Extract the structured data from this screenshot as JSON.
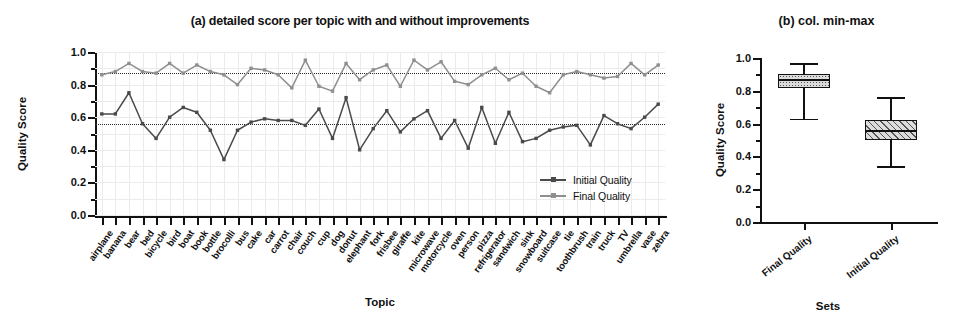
{
  "chart_data": [
    {
      "type": "line",
      "panel": "a",
      "title": "(a) detailed score per topic with and without improvements",
      "xlabel": "Topic",
      "ylabel": "Quality Score",
      "ylim": [
        0.0,
        1.0
      ],
      "yticks": [
        "0.0",
        "0.2",
        "0.4",
        "0.6",
        "0.8",
        "1.0"
      ],
      "grid": true,
      "legend_position": "bottom-right",
      "categories": [
        "airplane",
        "banana",
        "bear",
        "bed",
        "bicycle",
        "bird",
        "boat",
        "book",
        "bottle",
        "brocolli",
        "bus",
        "cake",
        "car",
        "carrot",
        "chair",
        "couch",
        "cup",
        "dog",
        "donut",
        "elephant",
        "fork",
        "frisbee",
        "giraffe",
        "kite",
        "microwave",
        "motorcycle",
        "oven",
        "person",
        "pizza",
        "refrigerator",
        "sandwich",
        "sink",
        "snowboard",
        "suitcase",
        "tie",
        "toothbrush",
        "train",
        "truck",
        "TV",
        "umbrella",
        "vase",
        "zebra"
      ],
      "series": [
        {
          "name": "Initial Quality",
          "color": "#4a4a4a",
          "values": [
            0.62,
            0.62,
            0.75,
            0.56,
            0.47,
            0.6,
            0.66,
            0.63,
            0.52,
            0.34,
            0.52,
            0.57,
            0.59,
            0.58,
            0.58,
            0.55,
            0.65,
            0.47,
            0.72,
            0.4,
            0.53,
            0.64,
            0.51,
            0.59,
            0.64,
            0.47,
            0.58,
            0.41,
            0.66,
            0.44,
            0.63,
            0.45,
            0.47,
            0.52,
            0.54,
            0.55,
            0.43,
            0.61,
            0.56,
            0.53,
            0.6,
            0.68
          ]
        },
        {
          "name": "Final Quality",
          "color": "#8f8f8f",
          "values": [
            0.86,
            0.88,
            0.93,
            0.88,
            0.87,
            0.93,
            0.87,
            0.92,
            0.88,
            0.86,
            0.8,
            0.9,
            0.89,
            0.86,
            0.78,
            0.95,
            0.79,
            0.76,
            0.93,
            0.83,
            0.89,
            0.92,
            0.79,
            0.95,
            0.89,
            0.94,
            0.82,
            0.8,
            0.86,
            0.9,
            0.83,
            0.87,
            0.79,
            0.75,
            0.86,
            0.88,
            0.86,
            0.84,
            0.85,
            0.93,
            0.86,
            0.92
          ]
        }
      ],
      "reference_lines": [
        {
          "label": "Final Quality mean",
          "value": 0.87
        },
        {
          "label": "Initial Quality mean",
          "value": 0.56
        }
      ]
    },
    {
      "type": "box",
      "panel": "b",
      "title": "(b) col. min-max",
      "xlabel": "Sets",
      "ylabel": "Quality Score",
      "ylim": [
        0.0,
        1.0
      ],
      "yticks": [
        "0.0",
        "0.2",
        "0.4",
        "0.6",
        "0.8",
        "1.0"
      ],
      "categories": [
        "Final Quality",
        "Initial Quality"
      ],
      "boxes": [
        {
          "name": "Final Quality",
          "min": 0.63,
          "q1": 0.82,
          "median": 0.87,
          "q3": 0.9,
          "max": 0.97,
          "fill": "dots"
        },
        {
          "name": "Initial Quality",
          "min": 0.34,
          "q1": 0.5,
          "median": 0.56,
          "q3": 0.62,
          "max": 0.76,
          "fill": "hatch"
        }
      ]
    }
  ]
}
